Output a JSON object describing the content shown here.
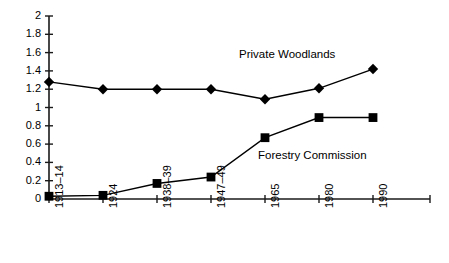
{
  "chart_data": {
    "type": "line",
    "title": "",
    "xlabel": "",
    "ylabel": "",
    "categories": [
      "1913–14",
      "1924",
      "1938–39",
      "1947–49",
      "1965",
      "1980",
      "1990"
    ],
    "ylim": [
      0,
      2
    ],
    "ytick_labels": [
      "0",
      "0.2",
      "0.4",
      "0.6",
      "0.8",
      "1",
      "1.2",
      "1.4",
      "1.6",
      "1.8",
      "2"
    ],
    "ytick_values": [
      0,
      0.2,
      0.4,
      0.6,
      0.8,
      1,
      1.2,
      1.4,
      1.6,
      1.8,
      2
    ],
    "grid": false,
    "legend_position": "inline-annotations",
    "series": [
      {
        "name": "Private Woodlands",
        "marker": "diamond",
        "color": "#000000",
        "values": [
          1.28,
          1.2,
          1.2,
          1.2,
          1.09,
          1.21,
          1.42
        ]
      },
      {
        "name": "Forestry Commission",
        "marker": "square",
        "color": "#000000",
        "values": [
          0.03,
          0.04,
          0.17,
          0.24,
          0.67,
          0.89,
          0.89
        ]
      }
    ],
    "annotations": [
      {
        "text": "Private Woodlands",
        "x_px": 239,
        "y_px": 48
      },
      {
        "text": "Forestry Commission",
        "x_px": 258,
        "y_px": 149
      }
    ]
  }
}
